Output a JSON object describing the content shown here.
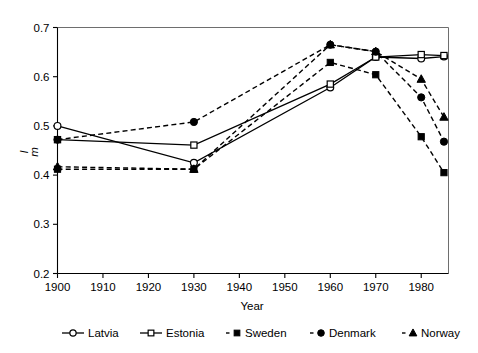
{
  "chart_data": {
    "type": "line",
    "title": "",
    "xlabel": "Year",
    "ylabel": "I m",
    "ylabel_main": "I",
    "ylabel_sub": "m",
    "xlim": [
      1900,
      1986
    ],
    "ylim": [
      0.2,
      0.7
    ],
    "x_ticks": [
      1900,
      1910,
      1920,
      1930,
      1940,
      1950,
      1960,
      1970,
      1980
    ],
    "x_tick_labels": [
      "1900",
      "1910",
      "1920",
      "1930",
      "1940",
      "1950",
      "1960",
      "1970",
      "1980"
    ],
    "y_ticks": [
      0.2,
      0.3,
      0.4,
      0.5,
      0.6,
      0.7
    ],
    "y_tick_labels": [
      "0.2",
      "0.3",
      "0.4",
      "0.5",
      "0.6",
      "0.7"
    ],
    "grid": false,
    "legend_position": "bottom",
    "series": [
      {
        "name": "Latvia",
        "marker": "open-circle",
        "line_style": "solid",
        "x": [
          1900,
          1930,
          1960,
          1970,
          1980,
          1985
        ],
        "values": [
          0.5,
          0.425,
          0.578,
          0.64,
          0.637,
          0.641
        ]
      },
      {
        "name": "Estonia",
        "marker": "open-square",
        "line_style": "solid",
        "x": [
          1900,
          1930,
          1960,
          1970,
          1980,
          1985
        ],
        "values": [
          0.472,
          0.461,
          0.585,
          0.64,
          0.645,
          0.643
        ]
      },
      {
        "name": "Sweden",
        "marker": "filled-square",
        "line_style": "dashed",
        "x": [
          1900,
          1930,
          1960,
          1970,
          1980,
          1985
        ],
        "values": [
          0.412,
          0.412,
          0.629,
          0.604,
          0.478,
          0.405
        ]
      },
      {
        "name": "Denmark",
        "marker": "filled-circle",
        "line_style": "dashed",
        "x": [
          1900,
          1930,
          1960,
          1970,
          1980,
          1985
        ],
        "values": [
          0.472,
          0.508,
          0.665,
          0.651,
          0.558,
          0.468
        ]
      },
      {
        "name": "Norway",
        "marker": "filled-triangle",
        "line_style": "dashed",
        "x": [
          1900,
          1930,
          1960,
          1970,
          1980,
          1985
        ],
        "values": [
          0.417,
          0.412,
          0.665,
          0.651,
          0.595,
          0.518
        ]
      }
    ],
    "legend": [
      {
        "label": "Latvia",
        "marker": "open-circle",
        "line_style": "solid"
      },
      {
        "label": "Estonia",
        "marker": "open-square",
        "line_style": "solid"
      },
      {
        "label": "Sweden",
        "marker": "filled-square",
        "line_style": "dashed"
      },
      {
        "label": "Denmark",
        "marker": "filled-circle",
        "line_style": "dashed"
      },
      {
        "label": "Norway",
        "marker": "filled-triangle",
        "line_style": "dashed"
      }
    ],
    "colors": {
      "line": "#000000",
      "axis": "#000000",
      "frame": "#6e6e6e",
      "background": "#ffffff"
    }
  }
}
